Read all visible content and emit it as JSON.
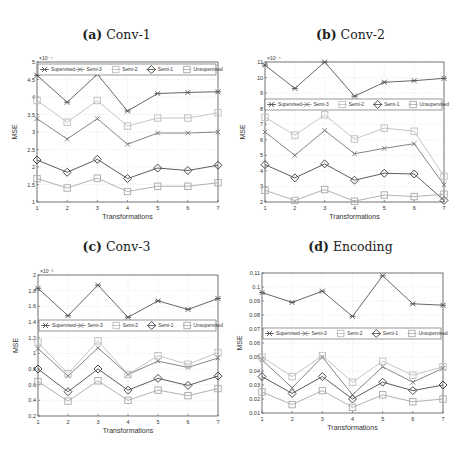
{
  "figure": {
    "panels": [
      {
        "label": "(a)",
        "name": "Conv-1"
      },
      {
        "label": "(b)",
        "name": "Conv-2"
      },
      {
        "label": "(c)",
        "name": "Conv-3"
      },
      {
        "label": "(d)",
        "name": "Encoding"
      }
    ]
  },
  "series_styles": {
    "Supervised": {
      "color": "#555555",
      "marker": "star"
    },
    "Semi-3": {
      "color": "#777777",
      "marker": "x"
    },
    "Semi-2": {
      "color": "#bdbdbd",
      "marker": "square"
    },
    "Semi-1": {
      "color": "#4a4a4a",
      "marker": "diamond"
    },
    "Unsupervised": {
      "color": "#a8a8a8",
      "marker": "square"
    }
  },
  "chart_data": [
    {
      "type": "line",
      "title": "(a) Conv-1",
      "xlabel": "Transformations",
      "ylabel": "MSE",
      "yscale_label": "×10⁻⁴",
      "x": [
        1,
        2,
        3,
        4,
        5,
        6,
        7
      ],
      "xlim": [
        1,
        7
      ],
      "ylim": [
        1,
        5
      ],
      "yticks": [
        1,
        1.5,
        2,
        2.5,
        3,
        3.5,
        4,
        4.5,
        5
      ],
      "ytick_labels": [
        "1",
        "1.5",
        "2",
        "2.5",
        "3",
        "3.5",
        "4",
        "4.5",
        "5"
      ],
      "legend_position": "top",
      "grid": true,
      "series": [
        {
          "name": "Supervised",
          "values": [
            4.62,
            3.85,
            4.65,
            3.6,
            4.1,
            4.13,
            4.15
          ]
        },
        {
          "name": "Semi-3",
          "values": [
            3.38,
            2.8,
            3.38,
            2.65,
            2.97,
            2.97,
            3.0
          ]
        },
        {
          "name": "Semi-2",
          "values": [
            3.9,
            3.28,
            3.9,
            3.17,
            3.4,
            3.4,
            3.55
          ]
        },
        {
          "name": "Semi-1",
          "values": [
            2.2,
            1.85,
            2.22,
            1.67,
            1.97,
            1.9,
            2.05
          ]
        },
        {
          "name": "Unsupervised",
          "values": [
            1.67,
            1.4,
            1.68,
            1.3,
            1.45,
            1.45,
            1.55
          ]
        }
      ]
    },
    {
      "type": "line",
      "title": "(b) Conv-2",
      "xlabel": "Transformations",
      "ylabel": "MSE",
      "yscale_label": "×10⁻⁴",
      "x": [
        1,
        2,
        3,
        4,
        5,
        6,
        7
      ],
      "xlim": [
        1,
        7
      ],
      "ylim": [
        2,
        11
      ],
      "yticks": [
        2,
        3,
        4,
        5,
        6,
        7,
        8,
        9,
        10,
        11
      ],
      "ytick_labels": [
        "2",
        "3",
        "4",
        "5",
        "6",
        "7",
        "8",
        "9",
        "10",
        "11"
      ],
      "legend_position": "middle",
      "grid": true,
      "series": [
        {
          "name": "Supervised",
          "values": [
            10.8,
            9.3,
            11.0,
            8.8,
            9.7,
            9.8,
            9.95
          ]
        },
        {
          "name": "Semi-3",
          "values": [
            6.5,
            5.0,
            6.6,
            5.1,
            5.45,
            5.75,
            3.1
          ]
        },
        {
          "name": "Semi-2",
          "values": [
            7.45,
            6.3,
            7.6,
            6.05,
            6.75,
            6.55,
            3.65
          ]
        },
        {
          "name": "Semi-1",
          "values": [
            4.4,
            3.55,
            4.45,
            3.4,
            3.85,
            3.8,
            2.1
          ]
        },
        {
          "name": "Unsupervised",
          "values": [
            2.75,
            2.1,
            2.8,
            2.05,
            2.45,
            2.35,
            2.5
          ]
        }
      ]
    },
    {
      "type": "line",
      "title": "(c) Conv-3",
      "xlabel": "Transformations",
      "ylabel": "MSE",
      "yscale_label": "×10⁻³",
      "x": [
        1,
        2,
        3,
        4,
        5,
        6,
        7
      ],
      "xlim": [
        1,
        7
      ],
      "ylim": [
        0.2,
        2
      ],
      "yticks": [
        0.2,
        0.4,
        0.6,
        0.8,
        1.0,
        1.2,
        1.4,
        1.6,
        1.8,
        2.0
      ],
      "ytick_labels": [
        "0.2",
        "0.4",
        "0.6",
        "0.8",
        "1",
        "1.2",
        "1.4",
        "1.6",
        "1.8",
        "2"
      ],
      "legend_position": "middle",
      "grid": true,
      "series": [
        {
          "name": "Supervised",
          "values": [
            1.83,
            1.48,
            1.87,
            1.46,
            1.67,
            1.56,
            1.7
          ]
        },
        {
          "name": "Semi-3",
          "values": [
            1.06,
            0.71,
            1.07,
            0.73,
            0.9,
            0.82,
            0.94
          ]
        },
        {
          "name": "Semi-2",
          "values": [
            1.14,
            0.74,
            1.16,
            0.73,
            0.97,
            0.86,
            1.01
          ]
        },
        {
          "name": "Semi-1",
          "values": [
            0.8,
            0.51,
            0.8,
            0.53,
            0.68,
            0.59,
            0.71
          ]
        },
        {
          "name": "Unsupervised",
          "values": [
            0.64,
            0.39,
            0.65,
            0.4,
            0.53,
            0.46,
            0.55
          ]
        }
      ]
    },
    {
      "type": "line",
      "title": "(d) Encoding",
      "xlabel": "Transformations",
      "ylabel": "MSE",
      "yscale_label": "",
      "x": [
        1,
        2,
        3,
        4,
        5,
        6,
        7
      ],
      "xlim": [
        1,
        7
      ],
      "ylim": [
        0.01,
        0.11
      ],
      "yticks": [
        0.01,
        0.02,
        0.03,
        0.04,
        0.05,
        0.06,
        0.07,
        0.08,
        0.09,
        0.1,
        0.11
      ],
      "ytick_labels": [
        "0.01",
        "0.02",
        "0.03",
        "0.04",
        "0.05",
        "0.06",
        "0.07",
        "0.08",
        "0.09",
        "0.1",
        "0.11"
      ],
      "legend_position": "middle",
      "grid": true,
      "series": [
        {
          "name": "Supervised",
          "values": [
            0.096,
            0.089,
            0.097,
            0.079,
            0.108,
            0.088,
            0.087
          ]
        },
        {
          "name": "Semi-3",
          "values": [
            0.048,
            0.028,
            0.05,
            0.023,
            0.043,
            0.032,
            0.042
          ]
        },
        {
          "name": "Semi-2",
          "values": [
            0.05,
            0.036,
            0.051,
            0.032,
            0.047,
            0.037,
            0.043
          ]
        },
        {
          "name": "Semi-1",
          "values": [
            0.036,
            0.024,
            0.036,
            0.02,
            0.032,
            0.026,
            0.03
          ]
        },
        {
          "name": "Unsupervised",
          "values": [
            0.025,
            0.016,
            0.026,
            0.014,
            0.023,
            0.018,
            0.02
          ]
        }
      ]
    }
  ]
}
